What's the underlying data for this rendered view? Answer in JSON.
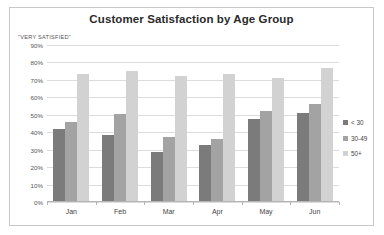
{
  "chart_data": {
    "type": "bar",
    "title": "Customer Satisfaction by Age Group",
    "xlabel": "",
    "ylabel": "\"VERY SATISFIED\"",
    "ylim": [
      0,
      90
    ],
    "ytick_step": 10,
    "ytick_labels": [
      "90%",
      "80%",
      "70%",
      "60%",
      "50%",
      "40%",
      "30%",
      "20%",
      "10%",
      "0%"
    ],
    "grid": true,
    "legend_position": "right",
    "categories": [
      "Jan",
      "Feb",
      "Mar",
      "Apr",
      "May",
      "Jun"
    ],
    "series": [
      {
        "name": "< 30",
        "color": "#7b7b7b",
        "values": [
          42,
          38.5,
          28.5,
          32.5,
          47.5,
          51
        ]
      },
      {
        "name": "30-49",
        "color": "#a3a3a3",
        "values": [
          46,
          50.5,
          37.5,
          36,
          52,
          56
        ]
      },
      {
        "name": "50+",
        "color": "#d2d2d2",
        "values": [
          73.5,
          75,
          72,
          73.5,
          71,
          77
        ]
      }
    ]
  },
  "legend": {
    "items": [
      {
        "label": "< 30"
      },
      {
        "label": "30-49"
      },
      {
        "label": "50+"
      }
    ]
  }
}
